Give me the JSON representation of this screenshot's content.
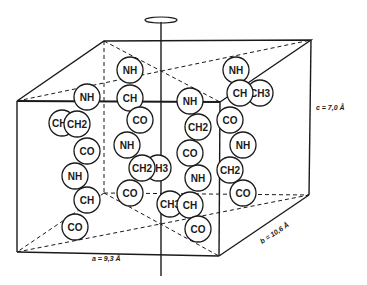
{
  "diagram": {
    "type": "crystal unit cell with polypeptide chains",
    "dimensions": {
      "a": "a = 9,3 Å",
      "b": "b = 10,6 Å",
      "c": "c = 7,0 Å"
    },
    "chains": [
      {
        "name": "chain-1",
        "groups": [
          {
            "label": "NH",
            "x": 87,
            "y": 97
          },
          {
            "label": "CH3",
            "x": 62,
            "y": 123
          },
          {
            "label": "CH2",
            "x": 77,
            "y": 124
          },
          {
            "label": "CO",
            "x": 87,
            "y": 151
          },
          {
            "label": "NH",
            "x": 75,
            "y": 176
          },
          {
            "label": "CH",
            "x": 87,
            "y": 200
          },
          {
            "label": "CO",
            "x": 75,
            "y": 227
          }
        ]
      },
      {
        "name": "chain-2",
        "groups": [
          {
            "label": "NH",
            "x": 130,
            "y": 70
          },
          {
            "label": "CH",
            "x": 130,
            "y": 98
          },
          {
            "label": "CO",
            "x": 140,
            "y": 120
          },
          {
            "label": "NH",
            "x": 127,
            "y": 145
          },
          {
            "label": "CH3",
            "x": 158,
            "y": 168
          },
          {
            "label": "CH2",
            "x": 142,
            "y": 168
          },
          {
            "label": "CO",
            "x": 130,
            "y": 193
          }
        ]
      },
      {
        "name": "chain-3",
        "groups": [
          {
            "label": "NH",
            "x": 190,
            "y": 101
          },
          {
            "label": "CH2",
            "x": 198,
            "y": 127
          },
          {
            "label": "CO",
            "x": 190,
            "y": 153
          },
          {
            "label": "NH",
            "x": 198,
            "y": 178
          },
          {
            "label": "CH3",
            "x": 170,
            "y": 204
          },
          {
            "label": "CH",
            "x": 190,
            "y": 205
          },
          {
            "label": "CO",
            "x": 198,
            "y": 229
          }
        ]
      },
      {
        "name": "chain-4",
        "groups": [
          {
            "label": "NH",
            "x": 236,
            "y": 70
          },
          {
            "label": "CH3",
            "x": 260,
            "y": 93
          },
          {
            "label": "CH",
            "x": 240,
            "y": 93
          },
          {
            "label": "CO",
            "x": 230,
            "y": 120
          },
          {
            "label": "NH",
            "x": 243,
            "y": 145
          },
          {
            "label": "CH2",
            "x": 230,
            "y": 170
          },
          {
            "label": "CO",
            "x": 243,
            "y": 193
          }
        ]
      }
    ]
  }
}
